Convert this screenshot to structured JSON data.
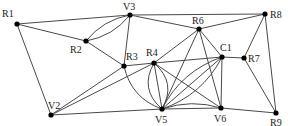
{
  "diagram": {
    "type": "graph",
    "nodes": [
      {
        "id": "R1",
        "label": "R1",
        "x": 17,
        "y": 24,
        "lx": 2,
        "ly": 17
      },
      {
        "id": "V3",
        "label": "V3",
        "x": 130,
        "y": 15,
        "lx": 123,
        "ly": 10
      },
      {
        "id": "R2",
        "label": "R2",
        "x": 86,
        "y": 41,
        "lx": 70,
        "ly": 53
      },
      {
        "id": "R3",
        "label": "R3",
        "x": 124,
        "y": 66,
        "lx": 126,
        "ly": 60
      },
      {
        "id": "R4",
        "label": "R4",
        "x": 154,
        "y": 63,
        "lx": 146,
        "ly": 56
      },
      {
        "id": "R6",
        "label": "R6",
        "x": 199,
        "y": 29,
        "lx": 192,
        "ly": 24
      },
      {
        "id": "C1",
        "label": "C1",
        "x": 222,
        "y": 57,
        "lx": 220,
        "ly": 51
      },
      {
        "id": "R7",
        "label": "R7",
        "x": 244,
        "y": 58,
        "lx": 248,
        "ly": 62
      },
      {
        "id": "R8",
        "label": "R8",
        "x": 265,
        "y": 14,
        "lx": 270,
        "ly": 18
      },
      {
        "id": "V2",
        "label": "V2",
        "x": 51,
        "y": 115,
        "lx": 48,
        "ly": 109
      },
      {
        "id": "V5",
        "label": "V5",
        "x": 162,
        "y": 109,
        "lx": 155,
        "ly": 123
      },
      {
        "id": "V6",
        "label": "V6",
        "x": 221,
        "y": 108,
        "lx": 214,
        "ly": 122
      },
      {
        "id": "R9",
        "label": "R9",
        "x": 276,
        "y": 113,
        "lx": 270,
        "ly": 126
      }
    ],
    "edges": [
      {
        "from": "R1",
        "to": "V3"
      },
      {
        "from": "R1",
        "to": "R2"
      },
      {
        "from": "R1",
        "to": "V2"
      },
      {
        "from": "V3",
        "to": "R2",
        "curve": -6
      },
      {
        "from": "V3",
        "to": "R2",
        "curve": 6
      },
      {
        "from": "V3",
        "to": "R3"
      },
      {
        "from": "V3",
        "to": "R6"
      },
      {
        "from": "V3",
        "to": "R8"
      },
      {
        "from": "R2",
        "to": "R3"
      },
      {
        "from": "R3",
        "to": "R4"
      },
      {
        "from": "R3",
        "to": "V2"
      },
      {
        "from": "R3",
        "to": "V5",
        "curve": 10
      },
      {
        "from": "R4",
        "to": "V2"
      },
      {
        "from": "R4",
        "to": "C1"
      },
      {
        "from": "R4",
        "to": "V5"
      },
      {
        "from": "R4",
        "to": "V5",
        "curve": 12
      },
      {
        "from": "R4",
        "to": "V5",
        "curve": -12
      },
      {
        "from": "R4",
        "to": "V6"
      },
      {
        "from": "R6",
        "to": "R8"
      },
      {
        "from": "R6",
        "to": "R4"
      },
      {
        "from": "R6",
        "to": "V5"
      },
      {
        "from": "R6",
        "to": "V6"
      },
      {
        "from": "R6",
        "to": "C1"
      },
      {
        "from": "C1",
        "to": "R7"
      },
      {
        "from": "C1",
        "to": "V5"
      },
      {
        "from": "C1",
        "to": "V5",
        "curve": 10
      },
      {
        "from": "C1",
        "to": "V5",
        "curve": -10
      },
      {
        "from": "C1",
        "to": "V6"
      },
      {
        "from": "R7",
        "to": "R8"
      },
      {
        "from": "R7",
        "to": "R9"
      },
      {
        "from": "R8",
        "to": "R9"
      },
      {
        "from": "V2",
        "to": "V5"
      },
      {
        "from": "V5",
        "to": "V6"
      },
      {
        "from": "V5",
        "to": "V6",
        "curve": -6
      },
      {
        "from": "V6",
        "to": "R9"
      }
    ],
    "colors": {
      "edge": "#4a4a4a",
      "node": "#000000",
      "label": "#222222",
      "background": "#ffffff"
    }
  }
}
